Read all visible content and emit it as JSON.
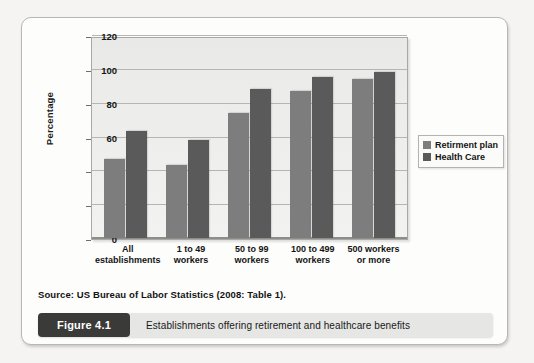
{
  "figure": {
    "number_label": "Figure 4.1",
    "caption": "Establishments offering retirement and healthcare benefits",
    "source": "Source: US Bureau of Labor Statistics (2008: Table 1)."
  },
  "colors": {
    "series1": "#7d7d7d",
    "series2": "#5a5a5a",
    "plot_background": "#ededeb",
    "card_background": "#fdfdfc",
    "pill_background": "#3a3a38",
    "caption_background": "#e6e6e4"
  },
  "chart_data": {
    "type": "bar",
    "title": "",
    "xlabel": "",
    "ylabel": "Percentage",
    "ylim": [
      0,
      120
    ],
    "yticks": [
      0,
      20,
      40,
      60,
      80,
      100,
      120
    ],
    "ytick_labels": [
      "0",
      "20",
      "40",
      "60",
      "80",
      "100",
      "120"
    ],
    "grid": true,
    "legend_position": "right",
    "categories": [
      "All establishments",
      "1 to 49 workers",
      "50 to 99 workers",
      "100 to 499 workers",
      "500 workers or more"
    ],
    "category_lines": [
      [
        "All",
        "establishments"
      ],
      [
        "1 to 49",
        "workers"
      ],
      [
        "50 to 99",
        "workers"
      ],
      [
        "100 to 499",
        "workers"
      ],
      [
        "500 workers",
        "or more"
      ]
    ],
    "series": [
      {
        "name": "Retirment plan",
        "color": "#7d7d7d",
        "values": [
          47,
          43,
          74,
          87,
          94
        ]
      },
      {
        "name": "Health Care",
        "color": "#5a5a5a",
        "values": [
          63,
          58,
          88,
          95,
          98
        ]
      }
    ]
  }
}
